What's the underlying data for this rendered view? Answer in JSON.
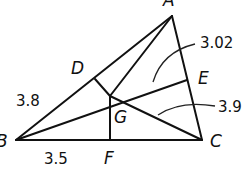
{
  "diagram": {
    "type": "triangle with centroid and medians",
    "vertices": {
      "A": {
        "label": "A"
      },
      "B": {
        "label": "B"
      },
      "C": {
        "label": "C"
      }
    },
    "points": {
      "D": {
        "label": "D"
      },
      "E": {
        "label": "E"
      },
      "F": {
        "label": "F"
      },
      "G": {
        "label": "G"
      }
    },
    "measurements": {
      "BD": "3.8",
      "BF": "3.5",
      "GE": "3.02",
      "GC": "3.9"
    }
  }
}
